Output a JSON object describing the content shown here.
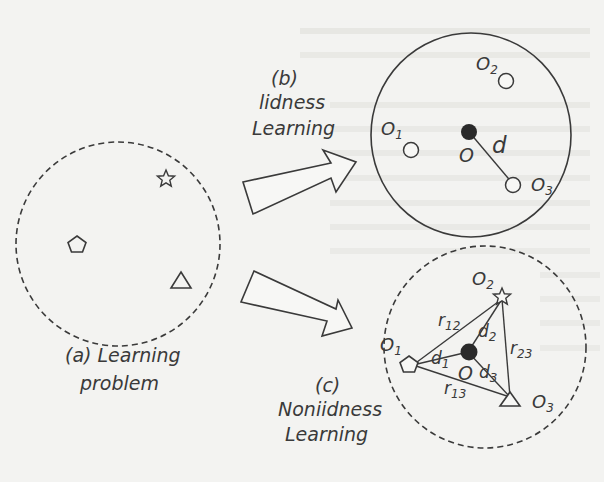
{
  "figure": {
    "panels": {
      "a": {
        "label_line1": "(a) Learning",
        "label_line2": "problem",
        "boundary": "dashed",
        "objects": [
          "star",
          "pentagon",
          "triangle"
        ]
      },
      "b": {
        "label_line1": "(b)",
        "label_line2": "lidness",
        "label_line3": "Learning",
        "boundary": "solid",
        "center_label": "O",
        "distance_label": "d",
        "nodes": [
          {
            "id": "O1",
            "base": "O",
            "sub": "1"
          },
          {
            "id": "O2",
            "base": "O",
            "sub": "2"
          },
          {
            "id": "O3",
            "base": "O",
            "sub": "3"
          }
        ]
      },
      "c": {
        "label_line1": "(c)",
        "label_line2": "Noniidness",
        "label_line3": "Learning",
        "boundary": "dashed",
        "center_label": "O",
        "nodes": [
          {
            "id": "O1",
            "base": "O",
            "sub": "1",
            "shape": "pentagon"
          },
          {
            "id": "O2",
            "base": "O",
            "sub": "2",
            "shape": "star"
          },
          {
            "id": "O3",
            "base": "O",
            "sub": "3",
            "shape": "triangle"
          }
        ],
        "center_distances": [
          {
            "base": "d",
            "sub": "1"
          },
          {
            "base": "d",
            "sub": "2"
          },
          {
            "base": "d",
            "sub": "3"
          }
        ],
        "pair_relations": [
          {
            "base": "r",
            "sub": "12"
          },
          {
            "base": "r",
            "sub": "13"
          },
          {
            "base": "r",
            "sub": "23"
          }
        ]
      }
    },
    "arrows": [
      {
        "from": "a",
        "to": "b"
      },
      {
        "from": "a",
        "to": "c"
      }
    ],
    "colors": {
      "ink": "#3a3a3a",
      "background": "#f3f3f1",
      "center_fill": "#2a2a2a"
    }
  }
}
